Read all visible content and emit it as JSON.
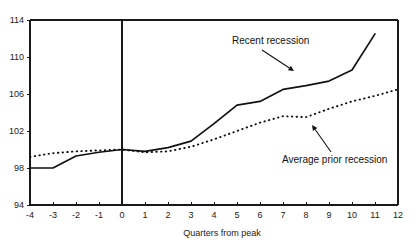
{
  "chart_data": {
    "type": "line",
    "title": "",
    "xlabel": "Quarters from peak",
    "ylabel": "",
    "xlim": [
      -4,
      12
    ],
    "ylim": [
      94,
      114
    ],
    "grid": false,
    "legend_position": "inline-annotations",
    "x": [
      -4,
      -3,
      -2,
      -1,
      0,
      1,
      2,
      3,
      4,
      5,
      6,
      7,
      8,
      9,
      10,
      11,
      12
    ],
    "xticks": [
      "-4",
      "-3",
      "-2",
      "-1",
      "0",
      "1",
      "2",
      "3",
      "4",
      "5",
      "6",
      "7",
      "8",
      "9",
      "10",
      "11",
      "12"
    ],
    "yticks": [
      "94",
      "98",
      "102",
      "106",
      "110",
      "114"
    ],
    "ytick_values": [
      94,
      98,
      102,
      106,
      110,
      114
    ],
    "series": [
      {
        "name": "Recent recession",
        "style": "solid",
        "x": [
          -4,
          -3,
          -2,
          -1,
          0,
          1,
          2,
          3,
          4,
          5,
          6,
          7,
          8,
          9,
          10,
          11
        ],
        "values": [
          98.0,
          98.0,
          99.3,
          99.7,
          100.0,
          99.8,
          100.2,
          100.9,
          102.8,
          104.8,
          105.2,
          106.5,
          106.9,
          107.4,
          108.6,
          112.5
        ]
      },
      {
        "name": "Average prior recession",
        "style": "dotted",
        "x": [
          -4,
          -3,
          -2,
          -1,
          0,
          1,
          2,
          3,
          4,
          5,
          6,
          7,
          8,
          9,
          10,
          11,
          12
        ],
        "values": [
          99.2,
          99.6,
          99.8,
          99.9,
          100.0,
          99.7,
          99.8,
          100.3,
          101.1,
          102.0,
          102.9,
          103.6,
          103.5,
          104.4,
          105.2,
          105.8,
          106.5
        ]
      }
    ],
    "annotations": [
      {
        "text": "Recent recession",
        "target_series": "Recent recession",
        "label_x": 232,
        "label_y": 44,
        "arrow_from_x": 262,
        "arrow_from_y": 50,
        "arrow_to_x": 294,
        "arrow_to_y": 71
      },
      {
        "text": "Average prior recession",
        "target_series": "Average prior recession",
        "label_x": 282,
        "label_y": 163,
        "arrow_from_x": 331,
        "arrow_from_y": 152,
        "arrow_to_x": 312,
        "arrow_to_y": 125
      }
    ],
    "reference_line": {
      "name": "peak-vertical-line",
      "x": 0
    }
  }
}
